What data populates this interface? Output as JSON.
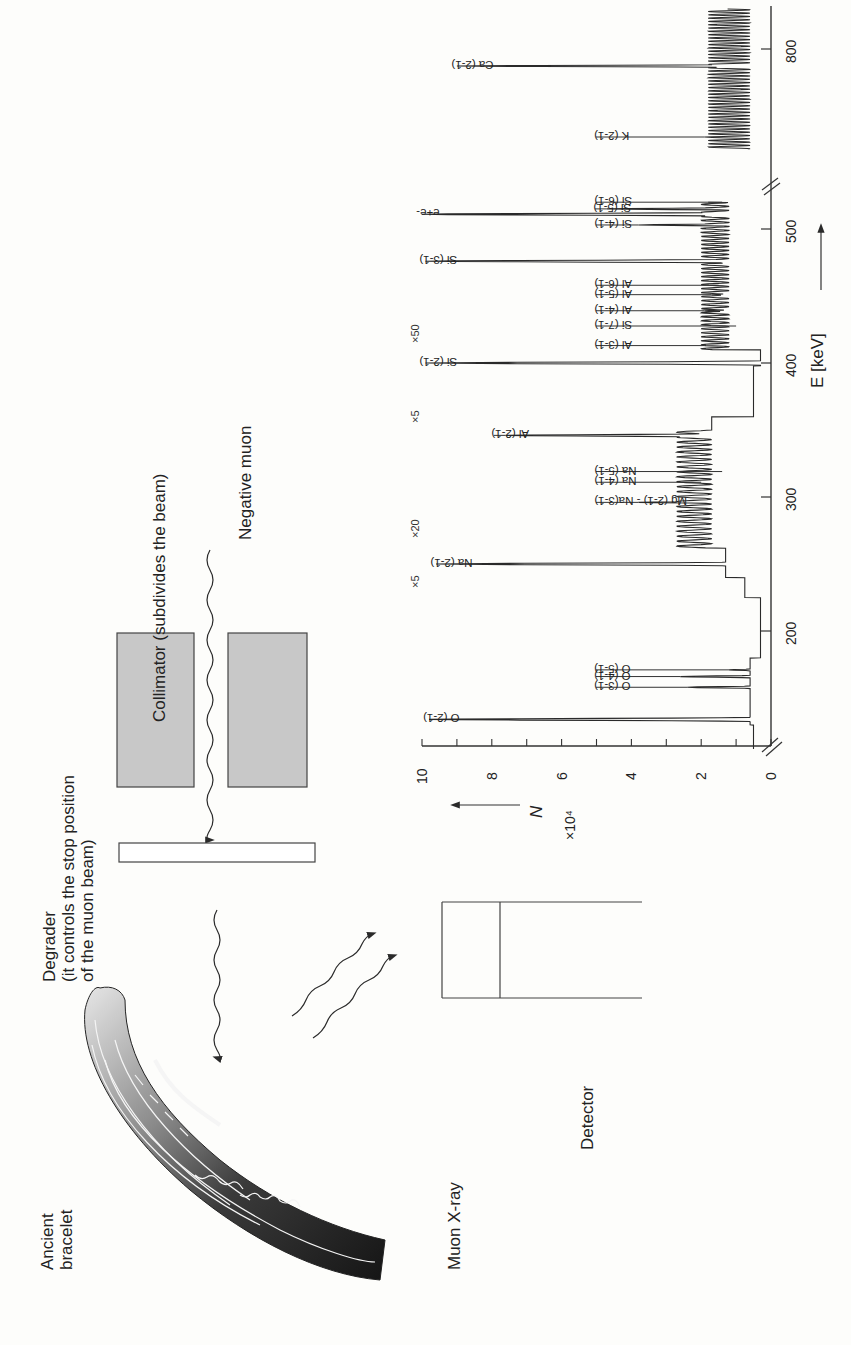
{
  "figure": {
    "labels": {
      "ancient_bracelet": [
        "Ancient",
        "bracelet"
      ],
      "degrader": [
        "Degrader",
        "(it controls the stop position",
        "of the muon beam)"
      ],
      "collimator": "Collimator (subdivides the beam)",
      "negative_muon": "Negative muon",
      "muon_xray": "Muon X-ray",
      "detector": "Detector"
    },
    "colors": {
      "line": "#2a2a2a",
      "collimator_fill": "#c8c8c8",
      "background": "#fdfdfb"
    }
  },
  "chart_data": {
    "type": "line",
    "title": "",
    "xlabel": "E [keV]",
    "ylabel": "N",
    "ylabel_multiplier": "×10⁴",
    "x_ticks": [
      200,
      300,
      400,
      500,
      800
    ],
    "y_ticks": [
      0,
      2,
      4,
      6,
      8,
      10
    ],
    "ylim": [
      0,
      10
    ],
    "xlim": [
      100,
      850
    ],
    "axis_break": [
      520,
      600
    ],
    "orientation": "rotated-90-ccw",
    "scale_factors": [
      {
        "label": "×5",
        "from_kev": 220
      },
      {
        "label": "×20",
        "from_kev": 260
      },
      {
        "label": "×5",
        "from_kev": 350
      },
      {
        "label": "×50",
        "from_kev": 405
      }
    ],
    "peaks": [
      {
        "label": "O (2-1)",
        "energy_kev": 134,
        "height": 9.8
      },
      {
        "label": "O (3-1)",
        "energy_kev": 158,
        "height": 2.4
      },
      {
        "label": "O (4-1)",
        "energy_kev": 166,
        "height": 2.6
      },
      {
        "label": "O (5-1)",
        "energy_kev": 171,
        "height": 1.2
      },
      {
        "label": "Na (2-1)",
        "energy_kev": 250,
        "height": 9.6
      },
      {
        "label": "Mg (2-1) - Na(3-1)",
        "energy_kev": 296,
        "height": 3.8
      },
      {
        "label": "Na (4-1)",
        "energy_kev": 311,
        "height": 2.0
      },
      {
        "label": "Na (5-1)",
        "energy_kev": 319,
        "height": 1.4
      },
      {
        "label": "Al (2-1)",
        "energy_kev": 346,
        "height": 7.6
      },
      {
        "label": "Si (2-1)",
        "energy_kev": 400,
        "height": 9.9
      },
      {
        "label": "Al (3-1)",
        "energy_kev": 413,
        "height": 1.9
      },
      {
        "label": "Al (4-1)",
        "energy_kev": 439,
        "height": 1.9
      },
      {
        "label": "Al (5-1)",
        "energy_kev": 451,
        "height": 1.7
      },
      {
        "label": "Al (6-1)",
        "energy_kev": 458,
        "height": 1.5
      },
      {
        "label": "Si (3-1)",
        "energy_kev": 476,
        "height": 9.9
      },
      {
        "label": "Si (4-1)",
        "energy_kev": 503,
        "height": 3.8
      },
      {
        "label": "e+e-",
        "energy_kev": 511,
        "height": 10.0
      },
      {
        "label": "Si (5-1)",
        "energy_kev": 515,
        "height": 4.7
      },
      {
        "label": "Si (6-1)",
        "energy_kev": 520,
        "height": 1.4
      },
      {
        "label": "Si (7-1)",
        "energy_kev": 523,
        "height": 1.0
      },
      {
        "label": "K (2-1)",
        "energy_kev": 712,
        "height": 1.9
      },
      {
        "label": "Ca (2-1)",
        "energy_kev": 783,
        "height": 9.0
      }
    ]
  }
}
